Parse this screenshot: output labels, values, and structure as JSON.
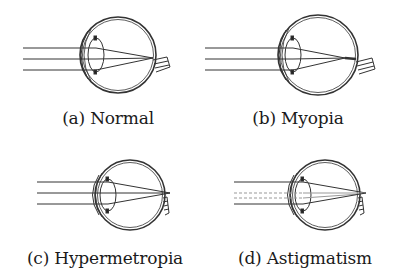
{
  "figure": {
    "panels": [
      {
        "id": "a",
        "label": "(a) Normal",
        "condition": "Normal",
        "focus": "on retina"
      },
      {
        "id": "b",
        "label": "(b) Myopia",
        "condition": "Myopia",
        "focus": "in front of retina"
      },
      {
        "id": "c",
        "label": "(c) Hypermetropia",
        "condition": "Hypermetropia",
        "focus": "behind retina"
      },
      {
        "id": "d",
        "label": "(d) Astigmatism",
        "condition": "Astigmatism",
        "focus": "multiple focal points"
      }
    ]
  },
  "colors": {
    "line": "#333333",
    "text": "#1a1a1a",
    "background": "#ffffff"
  }
}
